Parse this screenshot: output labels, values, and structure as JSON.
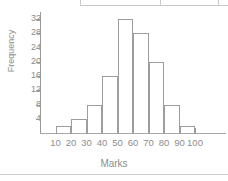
{
  "chart_data": {
    "type": "bar",
    "title": "",
    "subtitle": "",
    "xlabel": "Marks",
    "ylabel": "Frequency",
    "categories": [
      "10-20",
      "20-30",
      "30-40",
      "40-50",
      "50-60",
      "60-70",
      "70-80",
      "80-90",
      "90-100"
    ],
    "bin_edges": [
      10,
      20,
      30,
      40,
      50,
      60,
      70,
      80,
      90,
      100
    ],
    "values": [
      2,
      4,
      8,
      16,
      32,
      28,
      20,
      8,
      2
    ],
    "series": [
      {
        "name": "Frequency",
        "values": [
          2,
          4,
          8,
          16,
          32,
          28,
          20,
          8,
          2
        ]
      }
    ],
    "xtick_labels": [
      "10",
      "20",
      "30",
      "40",
      "50",
      "60",
      "70",
      "80",
      "90",
      "100"
    ],
    "xtick_values": [
      10,
      20,
      30,
      40,
      50,
      60,
      70,
      80,
      90,
      100
    ],
    "ytick_labels": [
      "4",
      "8",
      "12",
      "16",
      "20",
      "24",
      "28",
      "32"
    ],
    "ytick_values": [
      4,
      8,
      12,
      16,
      20,
      24,
      28,
      32
    ],
    "xlim": [
      0,
      120
    ],
    "ylim": [
      0,
      34
    ],
    "grid": false,
    "legend": false,
    "legend_position": "none",
    "bar_fill_color": "#ffffff",
    "bar_edge_color": "#9d9d9d",
    "axis_color": "#9a9a9a",
    "text_color": "#8d8d8d"
  }
}
